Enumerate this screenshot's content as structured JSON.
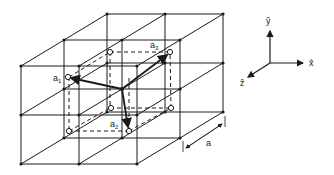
{
  "diagram": {
    "vectors": [
      {
        "name": "a",
        "sub": "1"
      },
      {
        "name": "a",
        "sub": "2"
      },
      {
        "name": "a",
        "sub": "3"
      }
    ],
    "lattice_constant_label": "a",
    "axes": {
      "x": "x̂",
      "y": "ŷ",
      "z": "ẑ"
    },
    "colors": {
      "line": "#1a1a1a",
      "background": "#ffffff"
    }
  }
}
